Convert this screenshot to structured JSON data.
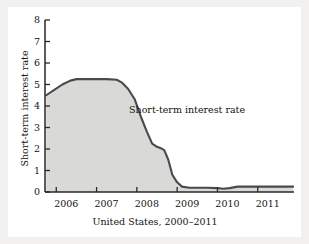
{
  "figure": {
    "background_color": "#f2f1ef",
    "card_color": "#ffffff"
  },
  "chart_data": {
    "type": "area",
    "title": "",
    "subtitle": "",
    "xlabel": "United States, 2000–2011",
    "ylabel": "Short-term interest rate",
    "annotations": [
      {
        "text": "Short-term interest rate",
        "x": 2008.1,
        "y": 4.1
      }
    ],
    "legend_position": "inline-annotation",
    "grid": false,
    "fill_color": "#d9d9d7",
    "line_color": "#4a4a4a",
    "axis_color": "#2a2724",
    "xlim": [
      2005.72,
      2011.9
    ],
    "ylim": [
      0,
      8
    ],
    "xticks": [
      2006.0,
      2007.0,
      2008.0,
      2009.0,
      2010.0,
      2011.0
    ],
    "xtick_labels": [
      "2006",
      "2007",
      "2008",
      "2009",
      "2010",
      "2011"
    ],
    "yticks": [
      0,
      1,
      2,
      3,
      4,
      5,
      6,
      7,
      8
    ],
    "ytick_labels": [
      "0",
      "1",
      "2",
      "3",
      "4",
      "5",
      "6",
      "7",
      "8"
    ],
    "series": [
      {
        "name": "Short-term interest rate",
        "x": [
          2005.75,
          2005.95,
          2006.15,
          2006.35,
          2006.5,
          2006.75,
          2007.0,
          2007.25,
          2007.5,
          2007.62,
          2007.78,
          2007.95,
          2008.1,
          2008.25,
          2008.38,
          2008.5,
          2008.58,
          2008.68,
          2008.78,
          2008.88,
          2009.0,
          2009.12,
          2009.3,
          2009.5,
          2009.75,
          2010.0,
          2010.15,
          2010.3,
          2010.5,
          2010.75,
          2011.0,
          2011.3,
          2011.6,
          2011.88
        ],
        "y": [
          4.5,
          4.75,
          5.0,
          5.18,
          5.25,
          5.25,
          5.25,
          5.25,
          5.22,
          5.1,
          4.8,
          4.3,
          3.5,
          2.8,
          2.25,
          2.1,
          2.05,
          1.95,
          1.5,
          0.8,
          0.45,
          0.25,
          0.2,
          0.2,
          0.2,
          0.18,
          0.15,
          0.18,
          0.25,
          0.25,
          0.25,
          0.25,
          0.25,
          0.25
        ]
      }
    ]
  }
}
